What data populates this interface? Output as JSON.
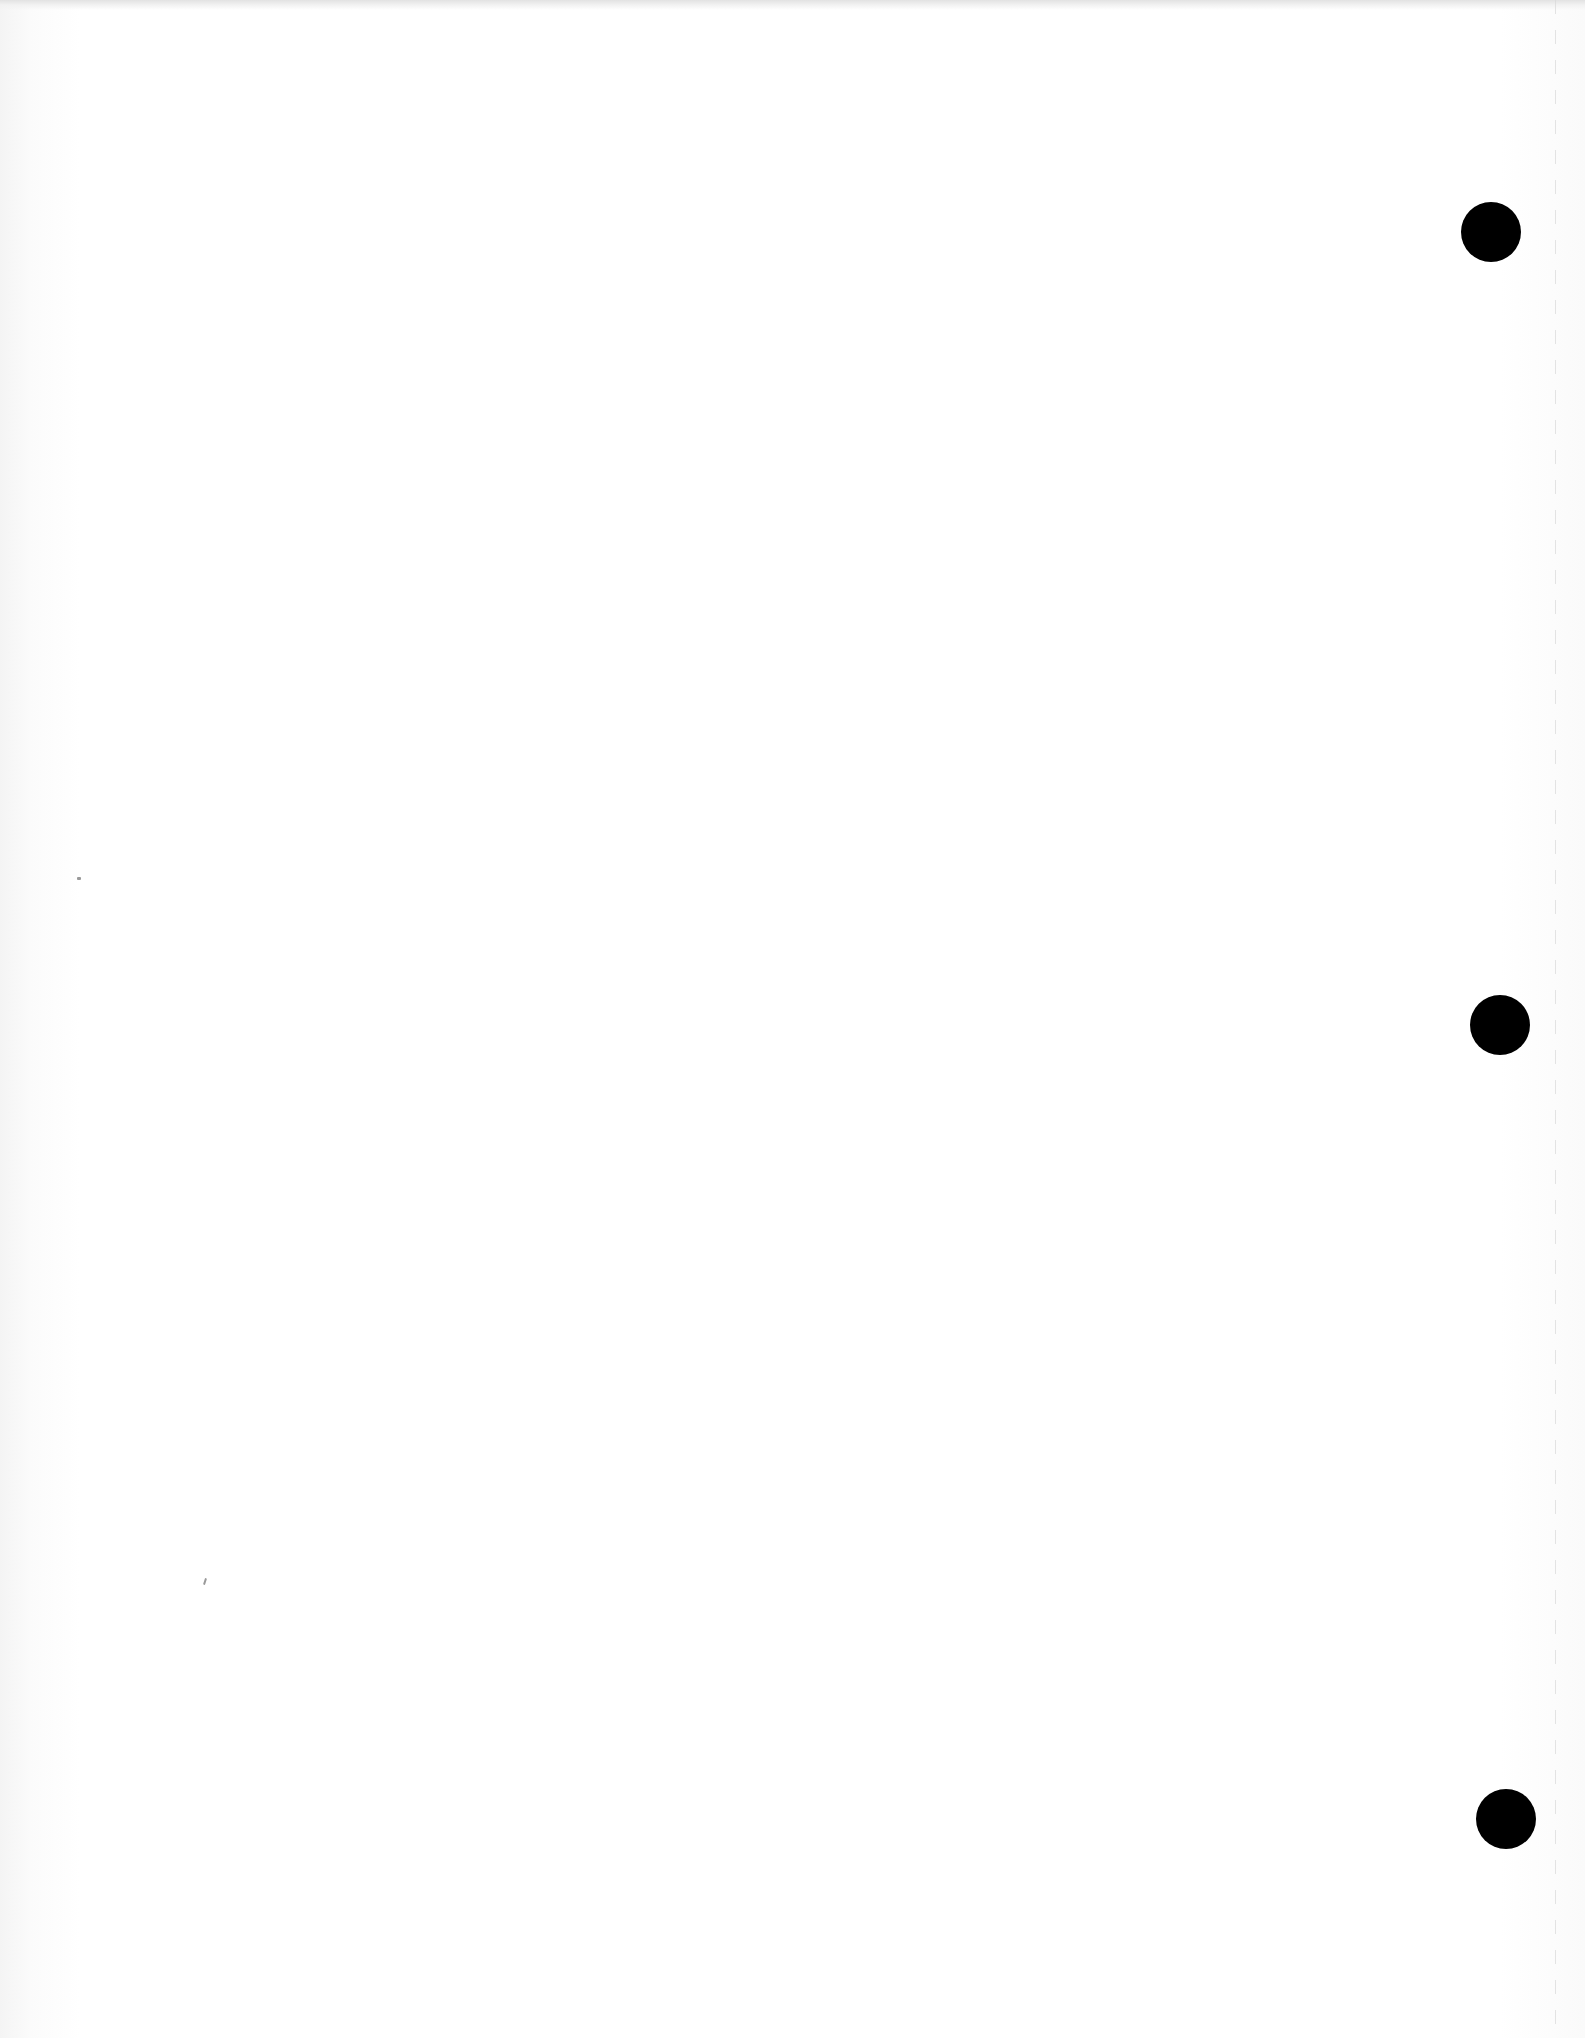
{
  "document": {
    "type": "blank scanned page",
    "text": "",
    "background_color": "#ffffff",
    "punch_holes": [
      {
        "cx": 1491,
        "cy": 232,
        "r": 30,
        "color": "#000000"
      },
      {
        "cx": 1500,
        "cy": 1025,
        "r": 30,
        "color": "#000000"
      },
      {
        "cx": 1506,
        "cy": 1819,
        "r": 30,
        "color": "#000000"
      }
    ]
  }
}
